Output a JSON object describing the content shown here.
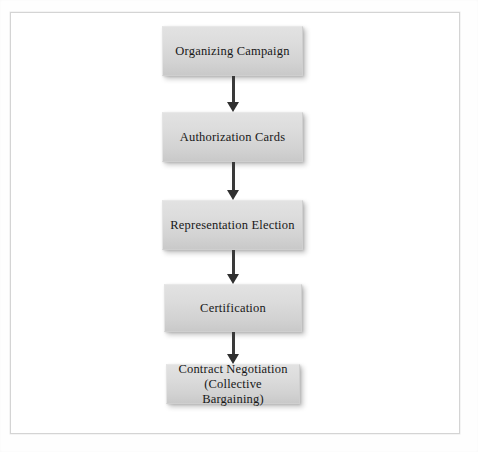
{
  "page": {
    "background_color": "#ffffff",
    "frame_color": "#d4d4d4"
  },
  "diagram": {
    "type": "flowchart",
    "orientation": "vertical top-to-bottom",
    "node_fill_color": "#dcdcdc",
    "node_text_color": "#171717",
    "arrow_color": "#303030",
    "nodes": [
      {
        "id": "organizing-campaign",
        "label": "Organizing Campaign"
      },
      {
        "id": "authorization-cards",
        "label": "Authorization Cards"
      },
      {
        "id": "representation-election",
        "label": "Representation Election"
      },
      {
        "id": "certification",
        "label": "Certification"
      },
      {
        "id": "contract-negotiation",
        "label": "Contract Negotiation\n(Collective Bargaining)"
      }
    ],
    "connectors": [
      {
        "from": "organizing-campaign",
        "to": "authorization-cards",
        "style": "arrow-down"
      },
      {
        "from": "authorization-cards",
        "to": "representation-election",
        "style": "arrow-down"
      },
      {
        "from": "representation-election",
        "to": "certification",
        "style": "arrow-down"
      },
      {
        "from": "certification",
        "to": "contract-negotiation",
        "style": "arrow-down"
      }
    ]
  }
}
